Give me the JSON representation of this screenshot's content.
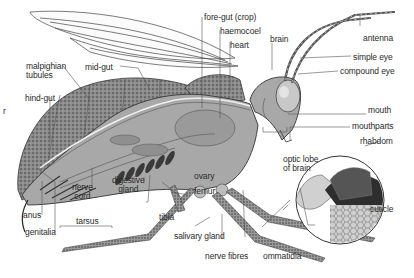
{
  "diagram": {
    "colors": {
      "outline": "#333333",
      "body_grey": "#9a9a9a",
      "inner_grey": "#b8b8b8",
      "dark": "#3a3a3a",
      "label_text": "#2a2a2a",
      "background": "#ffffff"
    },
    "labels": {
      "fore_gut": "fore-gut (crop)",
      "haemocoel": "haemocoel",
      "heart": "heart",
      "brain": "brain",
      "antenna": "antenna",
      "simple_eye": "simple eye",
      "compound_eye": "compound eye",
      "malpighian_1": "malpighian",
      "malpighian_2": "tubules",
      "mid_gut": "mid-gut",
      "hind_gut": "hind-gut",
      "mouth": "mouth",
      "mouthparts": "mouthparts",
      "rhabdom": "rhabdom",
      "optic_lobe_1": "optic lobe",
      "optic_lobe_2": "of brain",
      "ovary": "ovary",
      "femur": "femur",
      "nerve_cord_1": "nerve",
      "nerve_cord_2": "cord",
      "digestive_gland_1": "digestive",
      "digestive_gland_2": "gland",
      "cuticle": "cuticle",
      "tibia": "tibia",
      "anus": "anus",
      "genitalia": "genitalia",
      "tarsus": "tarsus",
      "salivary_gland": "salivary gland",
      "nerve_fibres": "nerve fibres",
      "ommatidia": "ommatidia",
      "left_edge_fragment": "r"
    }
  }
}
